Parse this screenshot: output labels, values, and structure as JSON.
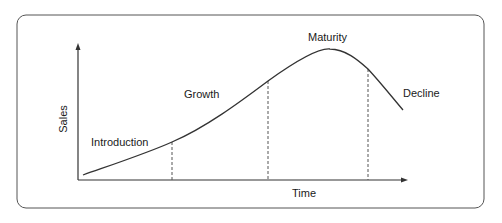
{
  "diagram": {
    "y_axis_label": "Sales",
    "x_axis_label": "Time",
    "stages": [
      {
        "label": "Introduction"
      },
      {
        "label": "Growth"
      },
      {
        "label": "Maturity"
      },
      {
        "label": "Decline"
      }
    ],
    "colors": {
      "border": "#555555",
      "curve": "#333333",
      "axis": "#333333",
      "divider": "#555555",
      "text": "#1a1a1a"
    }
  }
}
